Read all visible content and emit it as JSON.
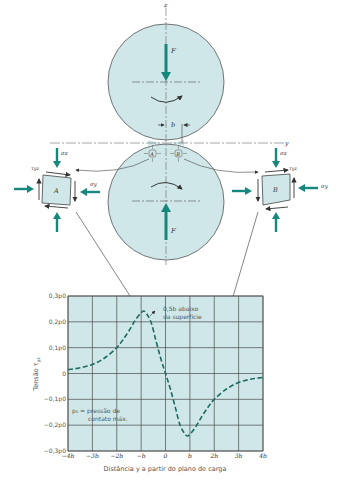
{
  "colors": {
    "fill": "#cfe7e8",
    "accent": "#16877c",
    "stroke": "#444444",
    "grid": "#4a4a4a",
    "curve": "#1d6b63"
  },
  "diagram": {
    "z_axis": "z",
    "y_axis": "y",
    "force_top": "F",
    "force_bottom": "F",
    "contact_width": "b",
    "point_a": "A",
    "point_b": "B",
    "element_a": {
      "label": "A",
      "sigma_z": "σz",
      "sigma_y": "σy",
      "tau": "τyz"
    },
    "element_b": {
      "label": "B",
      "sigma_z": "σz",
      "sigma_y": "σy",
      "tau": "τyz"
    }
  },
  "chart_data": {
    "type": "line",
    "title": "",
    "xlabel": "Distância y a partir do plano de carga",
    "ylabel": "Tensão τyz",
    "x_ticks": [
      "−4b",
      "−3b",
      "−2b",
      "−b",
      "0",
      "b",
      "2b",
      "3b",
      "4b"
    ],
    "y_ticks": [
      "0,3p0",
      "0,2p0",
      "0,1p0",
      "0",
      "−0,1p0",
      "−0,2p0",
      "−0,3p0"
    ],
    "xlim": [
      -4,
      4
    ],
    "ylim": [
      -0.3,
      0.3
    ],
    "grid": true,
    "annotations": [
      {
        "text": "0,5b abaixo da superfície",
        "x": -0.85,
        "y": 0.24
      },
      {
        "text": "p0 = pressão de contato máx.",
        "x": -3.5,
        "y": -0.15
      }
    ],
    "series": [
      {
        "name": "τyz at 0.5b below surface",
        "style": "dashed",
        "x": [
          -4,
          -3.5,
          -3,
          -2.5,
          -2,
          -1.75,
          -1.5,
          -1.25,
          -1,
          -0.85,
          -0.6,
          -0.4,
          -0.2,
          0,
          0.2,
          0.4,
          0.6,
          0.85,
          1,
          1.25,
          1.5,
          1.75,
          2,
          2.5,
          3,
          3.5,
          4
        ],
        "y": [
          0.015,
          0.022,
          0.035,
          0.06,
          0.1,
          0.13,
          0.165,
          0.205,
          0.235,
          0.24,
          0.2,
          0.13,
          0.06,
          0,
          -0.06,
          -0.13,
          -0.2,
          -0.24,
          -0.235,
          -0.205,
          -0.165,
          -0.13,
          -0.1,
          -0.06,
          -0.035,
          -0.022,
          -0.015
        ]
      }
    ]
  },
  "labels": {
    "ylabel_main": "Tensão τ",
    "ylabel_sub": "yz",
    "annotation_depth_1": "0,5b abaixo",
    "annotation_depth_2": "da superfície",
    "annotation_p0_1": "p₀ = pressão de",
    "annotation_p0_2": "contato máx.",
    "xlabel": "Distância y a partir do plano de carga"
  }
}
